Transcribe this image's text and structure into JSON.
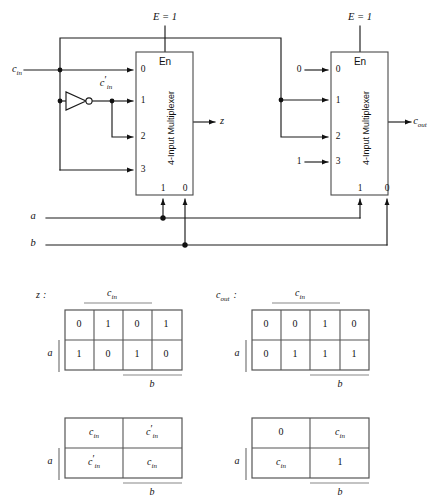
{
  "figure": {
    "signals": {
      "c_in": "c",
      "c_in_sub": "in",
      "c_in_not": "c",
      "c_in_not_sub": "in",
      "prime": "′",
      "a": "a",
      "b": "b",
      "z": "z",
      "c_out": "c",
      "c_out_sub": "out"
    },
    "enable": {
      "left_label": "E = 1",
      "right_label": "E = 1"
    },
    "mux_left": {
      "name": "4-Input Multiplexer",
      "enable_label": "En",
      "data_ports": [
        "0",
        "1",
        "2",
        "3"
      ],
      "select_ports": [
        "1",
        "0"
      ],
      "data_sources": [
        "c_in",
        "c_in_not",
        "c_in_not",
        "c_in"
      ],
      "select_sources": [
        "a",
        "b"
      ],
      "output": "z"
    },
    "mux_right": {
      "name": "4-Input Multiplexer",
      "enable_label": "En",
      "data_ports": [
        "0",
        "1",
        "2",
        "3"
      ],
      "select_ports": [
        "1",
        "0"
      ],
      "data_sources": [
        "0",
        "c_in",
        "c_in",
        "1"
      ],
      "data_input_labels": [
        "0",
        "",
        "",
        "1"
      ],
      "select_sources": [
        "a",
        "b"
      ],
      "output": "c_out"
    }
  },
  "kmaps": [
    {
      "id": "kmap-z-values",
      "name": "z",
      "name_suffix": ":",
      "top_label": "c_in",
      "bottom_label": "b",
      "left_label": "a",
      "columns": 4,
      "rows": [
        [
          "0",
          "1",
          "0",
          "1"
        ],
        [
          "1",
          "0",
          "1",
          "0"
        ]
      ]
    },
    {
      "id": "kmap-cout-values",
      "name": "c_out",
      "name_suffix": ":",
      "top_label": "c_in",
      "bottom_label": "b",
      "left_label": "a",
      "columns": 4,
      "rows": [
        [
          "0",
          "0",
          "1",
          "0"
        ],
        [
          "0",
          "1",
          "1",
          "1"
        ]
      ]
    },
    {
      "id": "kmap-z-reduced",
      "name": "",
      "name_suffix": "",
      "top_label": "",
      "bottom_label": "b",
      "left_label": "a",
      "columns": 2,
      "rows": [
        [
          "c_in",
          "c_in_prime"
        ],
        [
          "c_in_prime",
          "c_in"
        ]
      ]
    },
    {
      "id": "kmap-cout-reduced",
      "name": "",
      "name_suffix": "",
      "top_label": "",
      "bottom_label": "b",
      "left_label": "a",
      "columns": 2,
      "rows": [
        [
          "0",
          "c_in"
        ],
        [
          "c_in",
          "1"
        ]
      ]
    }
  ],
  "colors": {
    "wire": "#1b1b1b",
    "box": "#4a4a4a",
    "table": "#555555",
    "bar": "#888888",
    "background": "#ffffff"
  }
}
